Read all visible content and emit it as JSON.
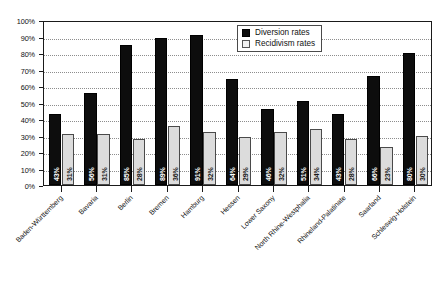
{
  "chart_data": {
    "type": "bar",
    "title": "",
    "xlabel": "",
    "ylabel": "",
    "ylim": [
      0,
      100
    ],
    "grid": true,
    "legend_position": "top-right",
    "y_ticks": [
      "0%",
      "10%",
      "20%",
      "30%",
      "40%",
      "50%",
      "60%",
      "70%",
      "80%",
      "90%",
      "100%"
    ],
    "y_tick_values": [
      0,
      10,
      20,
      30,
      40,
      50,
      60,
      70,
      80,
      90,
      100
    ],
    "categories": [
      "Baden-Württemberg",
      "Bavaria",
      "Berlin",
      "Bremen",
      "Hamburg",
      "Hessen",
      "Lower Saxony",
      "North Rhine-Westphalia",
      "Rhineland-Palatinate",
      "Saarland",
      "Schleswig-Holstein"
    ],
    "series": [
      {
        "name": "Diversion rates",
        "color": "#0d0d0d",
        "values": [
          43,
          56,
          85,
          89,
          91,
          64,
          46,
          51,
          43,
          66,
          80
        ],
        "labels": [
          "43%",
          "56%",
          "85%",
          "89%",
          "91%",
          "64%",
          "46%",
          "51%",
          "43%",
          "66%",
          "80%"
        ]
      },
      {
        "name": "Recidivism rates",
        "color": "#dcdcdc",
        "values": [
          31,
          31,
          28,
          36,
          32,
          29,
          32,
          34,
          28,
          23,
          30
        ],
        "labels": [
          "31%",
          "31%",
          "28%",
          "36%",
          "32%",
          "29%",
          "32%",
          "34%",
          "28%",
          "23%",
          "30%"
        ]
      }
    ]
  },
  "legend": {
    "items": [
      {
        "label": "Diversion rates",
        "swatch": "filled-black-square"
      },
      {
        "label": "Recidivism rates",
        "swatch": "outlined-light-square"
      }
    ]
  }
}
